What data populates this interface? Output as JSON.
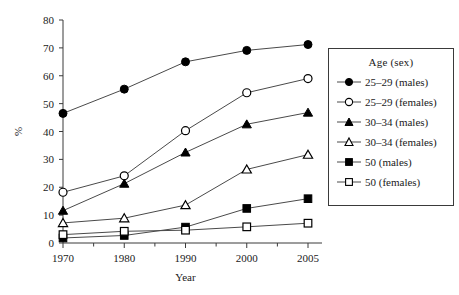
{
  "chart_data": {
    "type": "line",
    "title": "",
    "xlabel": "Year",
    "ylabel": "%",
    "x": [
      1970,
      1980,
      1990,
      2000,
      2005
    ],
    "categories": [
      "1970",
      "1980",
      "1990",
      "2000",
      "2005"
    ],
    "xticklabels": [
      "1970",
      "1980",
      "1990",
      "2000",
      "2005"
    ],
    "yticklabels": [
      "0",
      "10",
      "20",
      "30",
      "40",
      "50",
      "60",
      "70",
      "80"
    ],
    "yticks": [
      0,
      10,
      20,
      30,
      40,
      50,
      60,
      70,
      80
    ],
    "ylim": [
      0,
      80
    ],
    "grid": false,
    "legend_position": "right",
    "legend_title": "Age (sex)",
    "series": [
      {
        "name": "25–29 (males)",
        "marker": "filled-circle",
        "color": "#000000",
        "values": [
          46.5,
          55.2,
          65.0,
          69.1,
          71.2
        ]
      },
      {
        "name": "25–29 (females)",
        "marker": "open-circle",
        "color": "#000000",
        "values": [
          18.2,
          24.1,
          40.3,
          53.9,
          59.0
        ]
      },
      {
        "name": "30–34 (males)",
        "marker": "filled-triangle",
        "color": "#000000",
        "values": [
          11.6,
          21.3,
          32.5,
          42.6,
          46.8
        ]
      },
      {
        "name": "30–34 (females)",
        "marker": "open-triangle",
        "color": "#000000",
        "values": [
          7.2,
          8.9,
          13.6,
          26.4,
          31.7
        ]
      },
      {
        "name": "50 (males)",
        "marker": "filled-square",
        "color": "#000000",
        "values": [
          1.8,
          2.7,
          5.7,
          12.4,
          15.9
        ]
      },
      {
        "name": "50 (females)",
        "marker": "open-square",
        "color": "#000000",
        "values": [
          3.0,
          4.2,
          4.6,
          5.8,
          7.1
        ]
      }
    ]
  },
  "legend": {
    "title": "Age (sex)",
    "items": [
      {
        "label": "25–29 (males)",
        "marker": "filled-circle"
      },
      {
        "label": "25–29 (females)",
        "marker": "open-circle"
      },
      {
        "label": "30–34 (males)",
        "marker": "filled-triangle"
      },
      {
        "label": "30–34 (females)",
        "marker": "open-triangle"
      },
      {
        "label": "50 (males)",
        "marker": "filled-square"
      },
      {
        "label": "50 (females)",
        "marker": "open-square"
      }
    ]
  },
  "axes": {
    "x_title": "Year",
    "y_title": "%"
  },
  "colors": {
    "axis": "#3a3a3a",
    "line": "#4a4a4a",
    "marker": "#000000",
    "background": "#ffffff"
  }
}
